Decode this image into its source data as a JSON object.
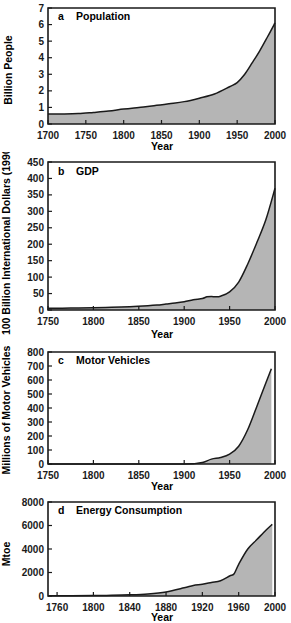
{
  "figure": {
    "name": "great-acceleration-four-panel-figure",
    "background_color": "#ffffff",
    "fill_color": "#b5b5b5",
    "line_color": "#1a1a1a"
  },
  "chart_data": [
    {
      "type": "area",
      "panel": "a",
      "letter": "a",
      "title": "Population",
      "xlabel": "Year",
      "ylabel": "Billion People",
      "xlim": [
        1700,
        2000
      ],
      "ylim": [
        0,
        7
      ],
      "xticks": [
        1700,
        1750,
        1800,
        1850,
        1900,
        1950,
        2000
      ],
      "yticks": [
        0,
        1,
        2,
        3,
        4,
        5,
        6,
        7
      ],
      "ytick_labels": [
        "0",
        "1",
        "2",
        "3",
        "4",
        "5",
        "6",
        "7"
      ],
      "xtick_labels": [
        "1700",
        "1750",
        "1800",
        "1850",
        "1900",
        "1950",
        "2000"
      ],
      "grid": false,
      "legend": "none",
      "x": [
        1700,
        1720,
        1740,
        1760,
        1780,
        1800,
        1820,
        1840,
        1860,
        1880,
        1900,
        1920,
        1940,
        1950,
        1960,
        1970,
        1980,
        1990,
        2000
      ],
      "values": [
        0.61,
        0.61,
        0.63,
        0.7,
        0.78,
        0.9,
        1.0,
        1.1,
        1.22,
        1.35,
        1.56,
        1.81,
        2.25,
        2.5,
        3.0,
        3.7,
        4.43,
        5.25,
        6.1
      ]
    },
    {
      "type": "area",
      "panel": "b",
      "letter": "b",
      "title": "GDP",
      "xlabel": "Year",
      "ylabel": "100 Billion International Dollars (1990)",
      "xlim": [
        1750,
        2000
      ],
      "ylim": [
        0,
        450
      ],
      "xticks": [
        1750,
        1800,
        1850,
        1900,
        1950,
        2000
      ],
      "yticks": [
        0,
        50,
        100,
        150,
        200,
        250,
        300,
        350,
        400,
        450
      ],
      "ytick_labels": [
        "0",
        "50",
        "100",
        "150",
        "200",
        "250",
        "300",
        "350",
        "400",
        "450"
      ],
      "xtick_labels": [
        "1750",
        "1800",
        "1850",
        "1900",
        "1950",
        "2000"
      ],
      "grid": false,
      "legend": "none",
      "x": [
        1750,
        1775,
        1800,
        1820,
        1840,
        1860,
        1870,
        1880,
        1890,
        1900,
        1910,
        1920,
        1925,
        1930,
        1935,
        1940,
        1950,
        1960,
        1970,
        1980,
        1990,
        2000
      ],
      "values": [
        5,
        6,
        7,
        8,
        10,
        13,
        15,
        18,
        21,
        25,
        31,
        35,
        40,
        41,
        40,
        42,
        55,
        85,
        140,
        205,
        275,
        370
      ]
    },
    {
      "type": "area",
      "panel": "c",
      "letter": "c",
      "title": "Motor Vehicles",
      "xlabel": "Year",
      "ylabel": "Millions of Motor Vehicles",
      "xlim": [
        1750,
        2000
      ],
      "ylim": [
        0,
        800
      ],
      "xticks": [
        1750,
        1800,
        1850,
        1900,
        1950,
        2000
      ],
      "yticks": [
        0,
        100,
        200,
        300,
        400,
        500,
        600,
        700,
        800
      ],
      "ytick_labels": [
        "0",
        "100",
        "200",
        "300",
        "400",
        "500",
        "600",
        "700",
        "800"
      ],
      "xtick_labels": [
        "1750",
        "1800",
        "1850",
        "1900",
        "1950",
        "2000"
      ],
      "grid": false,
      "legend": "none",
      "x": [
        1750,
        1850,
        1900,
        1910,
        1920,
        1930,
        1940,
        1950,
        1960,
        1970,
        1980,
        1990,
        1996
      ],
      "values": [
        0,
        0,
        0,
        2,
        10,
        35,
        46,
        70,
        127,
        246,
        411,
        580,
        680
      ]
    },
    {
      "type": "area",
      "panel": "d",
      "letter": "d",
      "title": "Energy Consumption",
      "xlabel": "Year",
      "ylabel": "Mtoe",
      "xlim": [
        1750,
        2000
      ],
      "ylim": [
        0,
        8000
      ],
      "xticks": [
        1760,
        1800,
        1840,
        1880,
        1920,
        1960,
        2000
      ],
      "yticks": [
        0,
        2000,
        4000,
        6000,
        8000
      ],
      "ytick_labels": [
        "0",
        "2000",
        "4000",
        "6000",
        "8000"
      ],
      "xtick_labels": [
        "1760",
        "1800",
        "1840",
        "1880",
        "1920",
        "1960",
        "2000"
      ],
      "grid": false,
      "legend": "none",
      "x": [
        1750,
        1800,
        1820,
        1840,
        1860,
        1880,
        1900,
        1910,
        1920,
        1930,
        1940,
        1950,
        1955,
        1960,
        1970,
        1980,
        1990,
        1997
      ],
      "values": [
        20,
        40,
        60,
        100,
        180,
        350,
        700,
        900,
        1000,
        1150,
        1300,
        1700,
        1900,
        2700,
        4000,
        4800,
        5600,
        6100
      ]
    }
  ]
}
